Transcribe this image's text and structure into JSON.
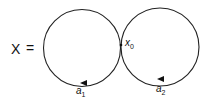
{
  "diagram": {
    "lhs_label": "X",
    "equals": "=",
    "basepoint_label": "x",
    "basepoint_sub": "0",
    "loop1": {
      "label": "a",
      "sub": "1"
    },
    "loop2": {
      "label": "a",
      "sub": "2"
    },
    "stroke_color": "#222222"
  }
}
